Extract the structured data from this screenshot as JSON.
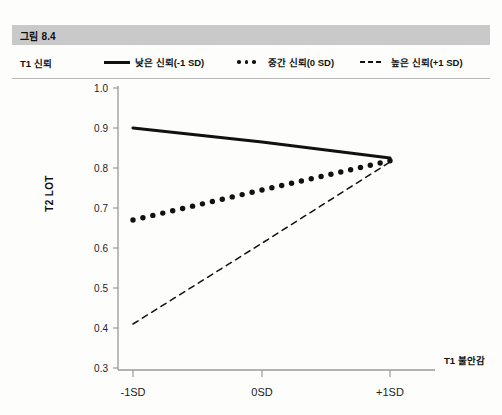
{
  "figure": {
    "band_label": "그림 8.4"
  },
  "legend": {
    "axis_name": "T1 신뢰",
    "items": [
      {
        "label": "낮은 신뢰(-1 SD)",
        "style": "solid",
        "key_icon": "solid-line-icon"
      },
      {
        "label": "중간 신뢰(0 SD)",
        "style": "dotted",
        "key_icon": "dotted-line-icon"
      },
      {
        "label": "높은 신뢰(+1 SD)",
        "style": "dashed",
        "key_icon": "dashed-line-icon"
      }
    ]
  },
  "colors": {
    "band": "#c9c9c9",
    "line": "#111111",
    "axis": "#9a9a9a",
    "page": "#fdfdfc"
  },
  "chart_data": {
    "type": "line",
    "title": "",
    "xlabel": "T1 불안감",
    "ylabel": "T2 LOT",
    "categories": [
      "-1SD",
      "0SD",
      "+1SD"
    ],
    "x": [
      -1,
      0,
      1
    ],
    "ylim": [
      0.3,
      1.0
    ],
    "yticks": [
      "1.0",
      "0.9",
      "0.8",
      "0.7",
      "0.6",
      "0.5",
      "0.4",
      "0.3"
    ],
    "ytick_values": [
      1.0,
      0.9,
      0.8,
      0.7,
      0.6,
      0.5,
      0.4,
      0.3
    ],
    "xticks": [
      "-1SD",
      "0SD",
      "+1SD"
    ],
    "grid": false,
    "legend_position": "top",
    "series": [
      {
        "name": "낮은 신뢰(-1 SD)",
        "style": "solid",
        "values": [
          0.9,
          0.865,
          0.825
        ]
      },
      {
        "name": "중간 신뢰(0 SD)",
        "style": "dotted",
        "values": [
          0.67,
          0.745,
          0.818
        ]
      },
      {
        "name": "높은 신뢰(+1 SD)",
        "style": "dashed",
        "values": [
          0.41,
          0.612,
          0.815
        ]
      }
    ]
  }
}
